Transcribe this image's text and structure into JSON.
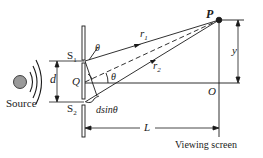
{
  "diagram": {
    "labels": {
      "source": "Source",
      "s1": "S",
      "s1_sub": "1",
      "s2": "S",
      "s2_sub": "2",
      "d": "d",
      "q": "Q",
      "theta_top": "θ",
      "theta_mid": "θ",
      "dsin": "dsinθ",
      "r1": "r",
      "r1_sub": "1",
      "r2": "r",
      "r2_sub": "2",
      "p": "P",
      "o": "O",
      "y": "y",
      "l": "L",
      "viewing_screen": "Viewing screen"
    },
    "colors": {
      "ink": "#1a1a1a",
      "source_fill": "#9a9a9a",
      "background": "#ffffff"
    }
  }
}
